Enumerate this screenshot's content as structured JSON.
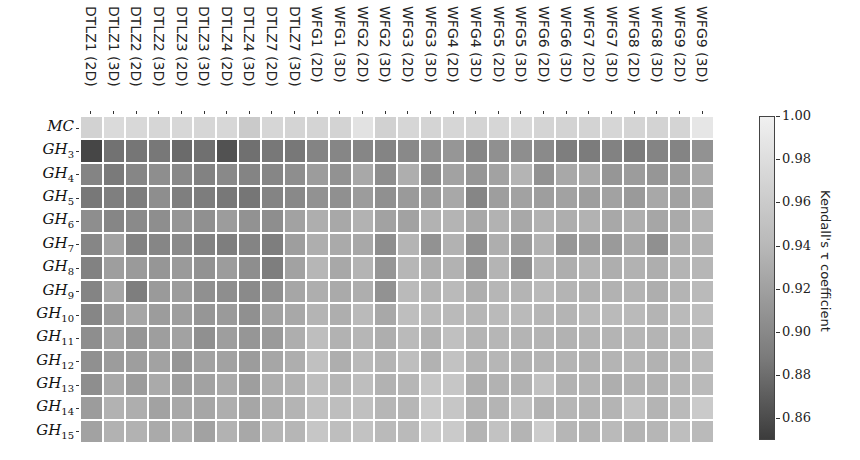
{
  "chart_data": {
    "type": "heatmap",
    "title": "",
    "xlabel": "",
    "ylabel": "",
    "colorbar_label": "Kendall's τ coefficient",
    "colorbar_range": [
      0.85,
      1.0
    ],
    "colorbar_ticks": [
      "0.86",
      "0.88",
      "0.90",
      "0.92",
      "0.94",
      "0.96",
      "0.98",
      "1.00"
    ],
    "colormap": "greys_reversed",
    "x_categories": [
      "DTLZ1 (2D)",
      "DTLZ1 (3D)",
      "DTLZ2 (2D)",
      "DTLZ2 (3D)",
      "DTLZ3 (2D)",
      "DTLZ3 (3D)",
      "DTLZ4 (2D)",
      "DTLZ4 (3D)",
      "DTLZ7 (2D)",
      "DTLZ7 (3D)",
      "WFG1 (2D)",
      "WFG1 (3D)",
      "WFG2 (2D)",
      "WFG2 (3D)",
      "WFG3 (2D)",
      "WFG3 (3D)",
      "WFG4 (2D)",
      "WFG4 (3D)",
      "WFG5 (2D)",
      "WFG5 (3D)",
      "WFG6 (2D)",
      "WFG6 (3D)",
      "WFG7 (2D)",
      "WFG7 (3D)",
      "WFG8 (2D)",
      "WFG8 (3D)",
      "WFG9 (2D)",
      "WFG9 (3D)"
    ],
    "y_categories": [
      {
        "base": "MC",
        "sub": ""
      },
      {
        "base": "GH",
        "sub": "3"
      },
      {
        "base": "GH",
        "sub": "4"
      },
      {
        "base": "GH",
        "sub": "5"
      },
      {
        "base": "GH",
        "sub": "6"
      },
      {
        "base": "GH",
        "sub": "7"
      },
      {
        "base": "GH",
        "sub": "8"
      },
      {
        "base": "GH",
        "sub": "9"
      },
      {
        "base": "GH",
        "sub": "10"
      },
      {
        "base": "GH",
        "sub": "11"
      },
      {
        "base": "GH",
        "sub": "12"
      },
      {
        "base": "GH",
        "sub": "13"
      },
      {
        "base": "GH",
        "sub": "14"
      },
      {
        "base": "GH",
        "sub": "15"
      }
    ],
    "values": [
      [
        0.975,
        0.982,
        0.98,
        0.978,
        0.979,
        0.978,
        0.979,
        0.968,
        0.978,
        0.977,
        0.977,
        0.976,
        0.988,
        0.974,
        0.978,
        0.977,
        0.978,
        0.977,
        0.978,
        0.98,
        0.977,
        0.976,
        0.976,
        0.978,
        0.977,
        0.976,
        0.977,
        0.992
      ],
      [
        0.858,
        0.895,
        0.898,
        0.9,
        0.889,
        0.893,
        0.868,
        0.893,
        0.9,
        0.9,
        0.91,
        0.912,
        0.912,
        0.91,
        0.914,
        0.92,
        0.925,
        0.912,
        0.92,
        0.918,
        0.915,
        0.905,
        0.903,
        0.908,
        0.903,
        0.91,
        0.91,
        0.922
      ],
      [
        0.91,
        0.902,
        0.912,
        0.918,
        0.914,
        0.908,
        0.914,
        0.91,
        0.912,
        0.918,
        0.93,
        0.922,
        0.94,
        0.918,
        0.945,
        0.918,
        0.935,
        0.925,
        0.935,
        0.95,
        0.922,
        0.94,
        0.942,
        0.925,
        0.93,
        0.925,
        0.93,
        0.942
      ],
      [
        0.9,
        0.906,
        0.904,
        0.918,
        0.906,
        0.904,
        0.9,
        0.898,
        0.91,
        0.914,
        0.922,
        0.92,
        0.93,
        0.92,
        0.928,
        0.928,
        0.94,
        0.912,
        0.932,
        0.935,
        0.932,
        0.935,
        0.932,
        0.935,
        0.928,
        0.94,
        0.935,
        0.94
      ],
      [
        0.918,
        0.912,
        0.915,
        0.918,
        0.925,
        0.92,
        0.93,
        0.922,
        0.918,
        0.935,
        0.945,
        0.94,
        0.948,
        0.935,
        0.935,
        0.948,
        0.95,
        0.94,
        0.948,
        0.94,
        0.948,
        0.945,
        0.948,
        0.94,
        0.945,
        0.938,
        0.942,
        0.95
      ],
      [
        0.912,
        0.935,
        0.908,
        0.912,
        0.915,
        0.908,
        0.905,
        0.91,
        0.905,
        0.932,
        0.945,
        0.942,
        0.94,
        0.918,
        0.95,
        0.922,
        0.948,
        0.92,
        0.945,
        0.93,
        0.948,
        0.925,
        0.93,
        0.928,
        0.94,
        0.92,
        0.945,
        0.948
      ],
      [
        0.908,
        0.932,
        0.928,
        0.925,
        0.928,
        0.922,
        0.93,
        0.918,
        0.905,
        0.935,
        0.952,
        0.94,
        0.95,
        0.925,
        0.952,
        0.945,
        0.948,
        0.925,
        0.95,
        0.92,
        0.95,
        0.945,
        0.95,
        0.945,
        0.948,
        0.945,
        0.95,
        0.952
      ],
      [
        0.91,
        0.938,
        0.905,
        0.928,
        0.93,
        0.92,
        0.918,
        0.915,
        0.92,
        0.938,
        0.945,
        0.942,
        0.945,
        0.922,
        0.955,
        0.95,
        0.955,
        0.945,
        0.952,
        0.95,
        0.955,
        0.95,
        0.948,
        0.948,
        0.95,
        0.945,
        0.95,
        0.955
      ],
      [
        0.912,
        0.928,
        0.938,
        0.93,
        0.932,
        0.925,
        0.928,
        0.92,
        0.935,
        0.94,
        0.95,
        0.945,
        0.955,
        0.94,
        0.958,
        0.955,
        0.955,
        0.952,
        0.955,
        0.955,
        0.952,
        0.95,
        0.955,
        0.955,
        0.955,
        0.95,
        0.955,
        0.958
      ],
      [
        0.918,
        0.935,
        0.925,
        0.932,
        0.935,
        0.92,
        0.932,
        0.925,
        0.928,
        0.945,
        0.958,
        0.948,
        0.952,
        0.945,
        0.955,
        0.948,
        0.96,
        0.95,
        0.952,
        0.95,
        0.95,
        0.948,
        0.95,
        0.95,
        0.952,
        0.95,
        0.952,
        0.955
      ],
      [
        0.92,
        0.93,
        0.932,
        0.935,
        0.925,
        0.935,
        0.935,
        0.93,
        0.938,
        0.945,
        0.96,
        0.945,
        0.955,
        0.95,
        0.958,
        0.948,
        0.962,
        0.95,
        0.952,
        0.948,
        0.95,
        0.95,
        0.948,
        0.95,
        0.952,
        0.948,
        0.95,
        0.955
      ],
      [
        0.918,
        0.94,
        0.93,
        0.942,
        0.932,
        0.935,
        0.942,
        0.932,
        0.945,
        0.948,
        0.958,
        0.952,
        0.958,
        0.948,
        0.952,
        0.965,
        0.965,
        0.945,
        0.948,
        0.948,
        0.962,
        0.948,
        0.95,
        0.945,
        0.948,
        0.948,
        0.952,
        0.955
      ],
      [
        0.93,
        0.948,
        0.945,
        0.935,
        0.94,
        0.938,
        0.945,
        0.938,
        0.945,
        0.95,
        0.96,
        0.958,
        0.96,
        0.952,
        0.952,
        0.968,
        0.965,
        0.948,
        0.95,
        0.96,
        0.948,
        0.952,
        0.95,
        0.95,
        0.962,
        0.95,
        0.955,
        0.968
      ],
      [
        0.935,
        0.948,
        0.948,
        0.942,
        0.945,
        0.935,
        0.948,
        0.94,
        0.952,
        0.952,
        0.965,
        0.958,
        0.962,
        0.955,
        0.955,
        0.968,
        0.968,
        0.95,
        0.962,
        0.95,
        0.97,
        0.952,
        0.95,
        0.955,
        0.95,
        0.952,
        0.958,
        0.955
      ]
    ]
  },
  "layout": {
    "grid_left": 80,
    "grid_top": 116,
    "cell_w": 22.64,
    "cell_h": 23.36,
    "gap": 2
  }
}
